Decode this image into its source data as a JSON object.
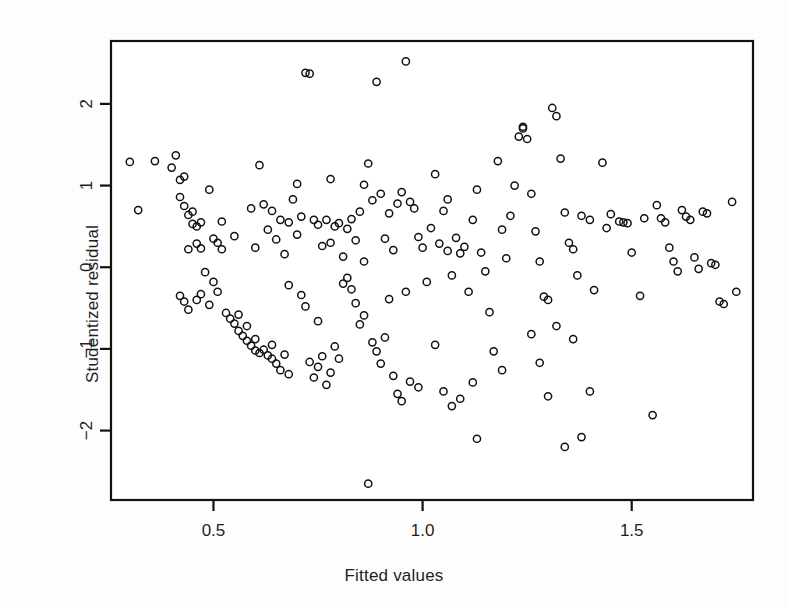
{
  "chart_data": {
    "type": "scatter",
    "title": "",
    "xlabel": "Fitted values",
    "ylabel": "Studentized residual",
    "xlim": [
      0.255,
      1.79
    ],
    "ylim": [
      -2.85,
      2.77
    ],
    "xticks": [
      0.5,
      1.0,
      1.5
    ],
    "xtick_labels": [
      "0.5",
      "1.0",
      "1.5"
    ],
    "yticks": [
      -2,
      -1,
      0,
      1,
      2
    ],
    "ytick_labels": [
      "-2",
      "-1",
      "0",
      "1",
      "2"
    ],
    "grid": false,
    "legend": null,
    "marker": {
      "shape": "open-circle",
      "radius_px": 3.6,
      "stroke": "#111111",
      "stroke_width": 1.5,
      "fill": "none"
    },
    "axis_color": "#111111",
    "background": "#ffffff",
    "n_points": 196,
    "points": [
      [
        0.3,
        1.29
      ],
      [
        0.32,
        0.7
      ],
      [
        0.36,
        1.3
      ],
      [
        0.4,
        1.22
      ],
      [
        0.41,
        1.37
      ],
      [
        0.42,
        0.86
      ],
      [
        0.42,
        1.07
      ],
      [
        0.43,
        1.11
      ],
      [
        0.43,
        0.75
      ],
      [
        0.44,
        0.64
      ],
      [
        0.44,
        0.22
      ],
      [
        0.45,
        0.68
      ],
      [
        0.45,
        0.53
      ],
      [
        0.46,
        0.5
      ],
      [
        0.46,
        0.29
      ],
      [
        0.47,
        0.55
      ],
      [
        0.47,
        0.23
      ],
      [
        0.48,
        -0.06
      ],
      [
        0.42,
        -0.35
      ],
      [
        0.43,
        -0.42
      ],
      [
        0.44,
        -0.52
      ],
      [
        0.46,
        -0.4
      ],
      [
        0.47,
        -0.33
      ],
      [
        0.49,
        -0.46
      ],
      [
        0.5,
        0.35
      ],
      [
        0.5,
        -0.18
      ],
      [
        0.51,
        0.3
      ],
      [
        0.52,
        0.56
      ],
      [
        0.52,
        0.22
      ],
      [
        0.53,
        -0.56
      ],
      [
        0.54,
        -0.63
      ],
      [
        0.55,
        -0.69
      ],
      [
        0.56,
        -0.78
      ],
      [
        0.56,
        -0.58
      ],
      [
        0.57,
        -0.84
      ],
      [
        0.58,
        -0.9
      ],
      [
        0.58,
        -0.72
      ],
      [
        0.59,
        -0.96
      ],
      [
        0.6,
        -1.02
      ],
      [
        0.6,
        -0.88
      ],
      [
        0.61,
        -1.05
      ],
      [
        0.62,
        -1.01
      ],
      [
        0.63,
        -1.08
      ],
      [
        0.64,
        -1.12
      ],
      [
        0.64,
        -0.95
      ],
      [
        0.65,
        -1.18
      ],
      [
        0.66,
        -1.26
      ],
      [
        0.67,
        -1.07
      ],
      [
        0.68,
        -1.31
      ],
      [
        0.59,
        0.72
      ],
      [
        0.6,
        0.24
      ],
      [
        0.61,
        1.25
      ],
      [
        0.62,
        0.77
      ],
      [
        0.63,
        0.46
      ],
      [
        0.64,
        0.69
      ],
      [
        0.65,
        0.34
      ],
      [
        0.66,
        0.58
      ],
      [
        0.67,
        0.16
      ],
      [
        0.68,
        0.55
      ],
      [
        0.69,
        0.83
      ],
      [
        0.7,
        0.4
      ],
      [
        0.7,
        1.02
      ],
      [
        0.71,
        0.62
      ],
      [
        0.72,
        2.38
      ],
      [
        0.73,
        2.37
      ],
      [
        0.71,
        -0.34
      ],
      [
        0.72,
        -0.48
      ],
      [
        0.73,
        -1.16
      ],
      [
        0.74,
        -1.35
      ],
      [
        0.75,
        -1.22
      ],
      [
        0.76,
        -1.09
      ],
      [
        0.77,
        -1.44
      ],
      [
        0.78,
        -1.29
      ],
      [
        0.79,
        -0.97
      ],
      [
        0.8,
        -1.12
      ],
      [
        0.74,
        0.58
      ],
      [
        0.75,
        0.52
      ],
      [
        0.76,
        0.26
      ],
      [
        0.77,
        0.58
      ],
      [
        0.78,
        0.3
      ],
      [
        0.79,
        0.5
      ],
      [
        0.8,
        0.54
      ],
      [
        0.81,
        0.13
      ],
      [
        0.82,
        0.47
      ],
      [
        0.83,
        0.59
      ],
      [
        0.84,
        0.33
      ],
      [
        0.85,
        0.68
      ],
      [
        0.86,
        1.01
      ],
      [
        0.87,
        1.27
      ],
      [
        0.88,
        0.82
      ],
      [
        0.89,
        2.27
      ],
      [
        0.81,
        -0.2
      ],
      [
        0.82,
        -0.13
      ],
      [
        0.83,
        -0.27
      ],
      [
        0.84,
        -0.44
      ],
      [
        0.85,
        -0.7
      ],
      [
        0.86,
        -0.59
      ],
      [
        0.87,
        -2.65
      ],
      [
        0.88,
        -0.92
      ],
      [
        0.89,
        -1.03
      ],
      [
        0.9,
        -1.18
      ],
      [
        0.91,
        -0.86
      ],
      [
        0.92,
        -0.39
      ],
      [
        0.9,
        0.9
      ],
      [
        0.91,
        0.35
      ],
      [
        0.92,
        0.66
      ],
      [
        0.93,
        0.21
      ],
      [
        0.94,
        0.78
      ],
      [
        0.95,
        0.92
      ],
      [
        0.96,
        2.52
      ],
      [
        0.97,
        0.8
      ],
      [
        0.98,
        0.72
      ],
      [
        0.99,
        0.37
      ],
      [
        1.0,
        0.24
      ],
      [
        1.01,
        -0.18
      ],
      [
        0.93,
        -1.33
      ],
      [
        0.94,
        -1.55
      ],
      [
        0.95,
        -1.64
      ],
      [
        0.97,
        -1.4
      ],
      [
        0.99,
        -1.47
      ],
      [
        1.02,
        0.48
      ],
      [
        1.03,
        1.14
      ],
      [
        1.04,
        0.29
      ],
      [
        1.05,
        0.69
      ],
      [
        1.06,
        0.2
      ],
      [
        1.07,
        -0.1
      ],
      [
        1.08,
        0.36
      ],
      [
        1.09,
        0.17
      ],
      [
        1.1,
        0.25
      ],
      [
        1.11,
        -0.3
      ],
      [
        1.03,
        -0.95
      ],
      [
        1.05,
        -1.52
      ],
      [
        1.07,
        -1.7
      ],
      [
        1.09,
        -1.61
      ],
      [
        1.13,
        -2.1
      ],
      [
        1.12,
        0.58
      ],
      [
        1.13,
        0.95
      ],
      [
        1.14,
        0.18
      ],
      [
        1.15,
        -0.05
      ],
      [
        1.16,
        -0.55
      ],
      [
        1.17,
        -1.03
      ],
      [
        1.18,
        1.3
      ],
      [
        1.19,
        0.46
      ],
      [
        1.2,
        0.11
      ],
      [
        1.21,
        0.63
      ],
      [
        1.22,
        1.0
      ],
      [
        1.23,
        1.6
      ],
      [
        1.24,
        1.72
      ],
      [
        1.24,
        1.7
      ],
      [
        1.25,
        1.57
      ],
      [
        1.26,
        0.9
      ],
      [
        1.27,
        0.44
      ],
      [
        1.28,
        0.07
      ],
      [
        1.29,
        -0.36
      ],
      [
        1.26,
        -0.82
      ],
      [
        1.28,
        -1.17
      ],
      [
        1.3,
        -1.58
      ],
      [
        1.31,
        1.95
      ],
      [
        1.32,
        1.85
      ],
      [
        1.33,
        1.33
      ],
      [
        1.34,
        0.67
      ],
      [
        1.35,
        0.3
      ],
      [
        1.3,
        -0.4
      ],
      [
        1.32,
        -0.72
      ],
      [
        1.34,
        -2.2
      ],
      [
        1.38,
        -2.08
      ],
      [
        1.4,
        -1.52
      ],
      [
        1.36,
        0.22
      ],
      [
        1.37,
        -0.1
      ],
      [
        1.38,
        0.63
      ],
      [
        1.4,
        0.58
      ],
      [
        1.41,
        -0.28
      ],
      [
        1.43,
        1.28
      ],
      [
        1.45,
        0.65
      ],
      [
        1.47,
        0.56
      ],
      [
        1.48,
        0.55
      ],
      [
        1.49,
        0.54
      ],
      [
        1.5,
        0.18
      ],
      [
        1.52,
        -0.35
      ],
      [
        1.55,
        -1.81
      ],
      [
        1.56,
        0.76
      ],
      [
        1.57,
        0.6
      ],
      [
        1.58,
        0.55
      ],
      [
        1.59,
        0.24
      ],
      [
        1.6,
        0.07
      ],
      [
        1.61,
        -0.05
      ],
      [
        1.62,
        0.7
      ],
      [
        1.63,
        0.62
      ],
      [
        1.64,
        0.58
      ],
      [
        1.65,
        0.12
      ],
      [
        1.66,
        -0.02
      ],
      [
        1.67,
        0.68
      ],
      [
        1.68,
        0.66
      ],
      [
        1.69,
        0.05
      ],
      [
        1.7,
        0.03
      ],
      [
        1.71,
        -0.42
      ],
      [
        1.72,
        -0.45
      ],
      [
        1.74,
        0.8
      ],
      [
        1.75,
        -0.3
      ],
      [
        0.55,
        0.38
      ],
      [
        0.68,
        -0.22
      ],
      [
        0.75,
        -0.66
      ],
      [
        0.86,
        0.07
      ],
      [
        1.06,
        0.83
      ],
      [
        1.19,
        -1.26
      ],
      [
        1.44,
        0.48
      ],
      [
        1.53,
        0.6
      ],
      [
        0.49,
        0.95
      ],
      [
        0.51,
        -0.3
      ],
      [
        0.78,
        1.08
      ],
      [
        0.96,
        -0.3
      ],
      [
        1.12,
        -1.41
      ],
      [
        1.36,
        -0.88
      ]
    ]
  },
  "axes": {
    "x_label": "Fitted values",
    "y_label": "Studentized residual"
  }
}
